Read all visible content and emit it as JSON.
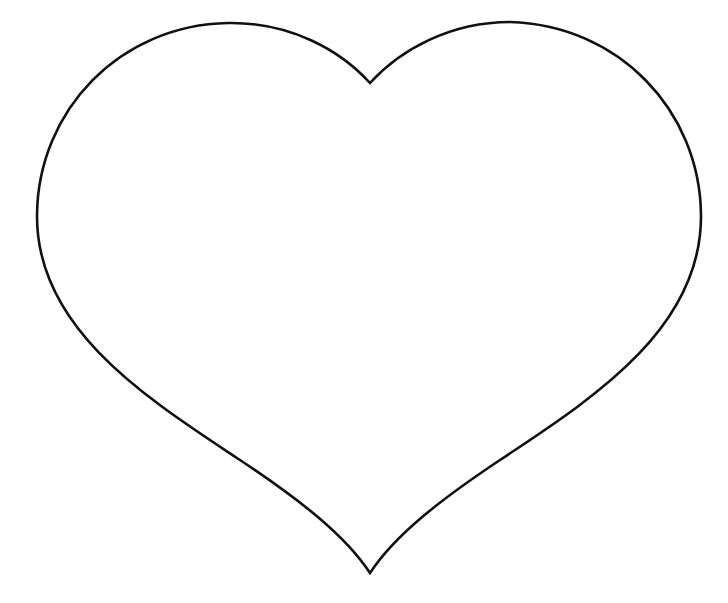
{
  "image": {
    "subject": "heart outline",
    "background_color": "#ffffff",
    "stroke_color": "#111111",
    "stroke_width": 2.6
  }
}
